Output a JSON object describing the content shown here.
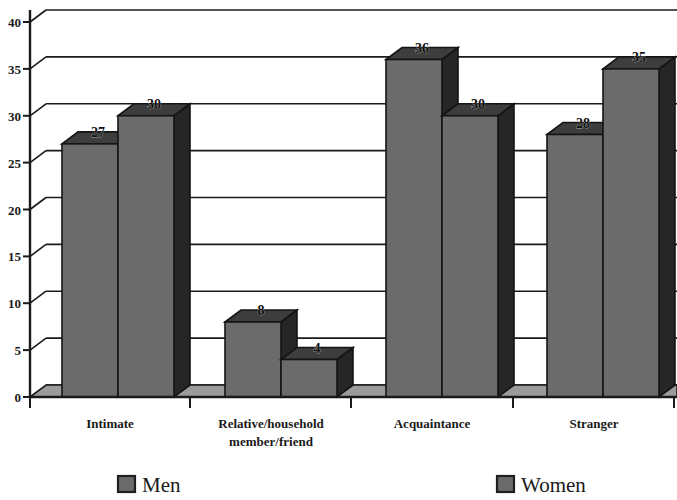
{
  "chart_data": {
    "type": "bar",
    "title": "",
    "subtitle": "",
    "xlabel": "",
    "ylabel": "",
    "categories": [
      "Intimate",
      "Relative/household member/friend",
      "Acquaintance",
      "Stranger"
    ],
    "category_lines": [
      [
        "Intimate"
      ],
      [
        "Relative/household",
        "member/friend"
      ],
      [
        "Acquaintance"
      ],
      [
        "Stranger"
      ]
    ],
    "series": [
      {
        "name": "Men",
        "values": [
          27,
          8,
          36,
          28
        ],
        "color": "#6b6b6b"
      },
      {
        "name": "Women",
        "values": [
          30,
          4,
          30,
          35
        ],
        "color": "#6b6b6b"
      }
    ],
    "ylim": [
      0,
      40
    ],
    "yticks": [
      0,
      5,
      10,
      15,
      20,
      25,
      30,
      35,
      40
    ],
    "ytick_labels": [
      "0",
      "5",
      "10",
      "15",
      "20",
      "25",
      "30",
      "35",
      "40"
    ],
    "grid": true,
    "grid_orientation": "horizontal",
    "legend_position": "bottom",
    "style": "3d-column",
    "data_labels": true
  },
  "axis": {
    "y_ticks": [
      {
        "value": 40,
        "label": "40"
      },
      {
        "value": 35,
        "label": "35"
      },
      {
        "value": 30,
        "label": "30"
      },
      {
        "value": 25,
        "label": "25"
      },
      {
        "value": 20,
        "label": "20"
      },
      {
        "value": 15,
        "label": "15"
      },
      {
        "value": 10,
        "label": "10"
      },
      {
        "value": 5,
        "label": "5"
      },
      {
        "value": 0,
        "label": "0"
      }
    ]
  },
  "legend": {
    "items": [
      {
        "label": "Men",
        "swatch": "#6b6b6b"
      },
      {
        "label": "Women",
        "swatch": "#6b6b6b"
      }
    ]
  },
  "colors": {
    "bar_front": "#6b6b6b",
    "bar_side": "#262626",
    "bar_top": "#3d3d3d",
    "floor": "#9b9b9b",
    "axis": "#1a1a1a",
    "grid": "#1a1a1a",
    "background": "#ffffff"
  }
}
